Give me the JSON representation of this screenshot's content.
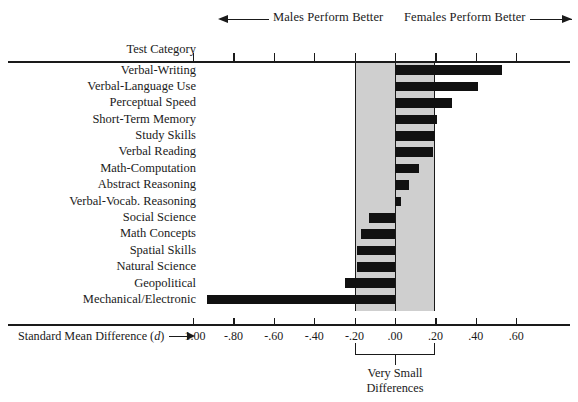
{
  "header": {
    "males_label": "Males Perform Better",
    "females_label": "Females Perform Better",
    "left_arrow_icon": "arrow-left-icon",
    "right_arrow_icon": "arrow-right-icon"
  },
  "column_header": "Test Category",
  "axis": {
    "title_prefix": "Standard Mean Difference (",
    "title_symbol": "d",
    "title_suffix": ")",
    "tick_labels": [
      "-1.00",
      "-.80",
      "-.60",
      "-.40",
      "-.20",
      ".00",
      ".20",
      ".40",
      ".60"
    ],
    "tick_values": [
      -1.0,
      -0.8,
      -0.6,
      -0.4,
      -0.2,
      0.0,
      0.2,
      0.4,
      0.6
    ]
  },
  "annotation": {
    "bracket_caption_line1": "Very Small",
    "bracket_caption_line2": "Differences",
    "band_from": -0.2,
    "band_to": 0.2
  },
  "colors": {
    "bar": "#111111",
    "band": "#cfcfcf",
    "axis": "#1a1a1a",
    "background": "#ffffff"
  },
  "chart_data": {
    "type": "bar",
    "orientation": "horizontal",
    "title": "",
    "subtitle": "",
    "xlabel": "Standard Mean Difference (d)",
    "ylabel": "Test Category",
    "xlim": [
      -1.1,
      0.68
    ],
    "grid": false,
    "legend": null,
    "categories": [
      "Verbal-Writing",
      "Verbal-Language Use",
      "Perceptual Speed",
      "Short-Term Memory",
      "Study Skills",
      "Verbal Reading",
      "Math-Computation",
      "Abstract Reasoning",
      "Verbal-Vocab. Reasoning",
      "Social Science",
      "Math Concepts",
      "Spatial Skills",
      "Natural Science",
      "Geopolitical",
      "Mechanical/Electronic"
    ],
    "values": [
      0.53,
      0.41,
      0.28,
      0.21,
      0.2,
      0.19,
      0.12,
      0.07,
      0.03,
      -0.13,
      -0.17,
      -0.19,
      -0.19,
      -0.25,
      -0.93
    ],
    "annotations": [
      "Males Perform Better",
      "Females Perform Better",
      "Very Small Differences"
    ]
  }
}
